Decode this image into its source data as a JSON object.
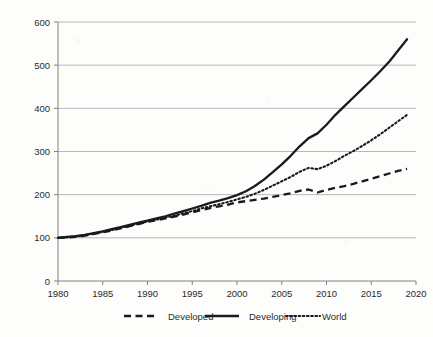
{
  "chart_data": {
    "type": "line",
    "title": "",
    "subtitle": "",
    "xlabel": "",
    "ylabel": "",
    "xlim": [
      1980,
      2020
    ],
    "ylim": [
      0,
      600
    ],
    "xticks": [
      1980,
      1985,
      1990,
      1995,
      2000,
      2005,
      2010,
      2015,
      2020
    ],
    "yticks": [
      0,
      100,
      200,
      300,
      400,
      500,
      600
    ],
    "grid": "horizontal",
    "legend_position": "bottom",
    "background_color": "#fdfdfb",
    "axis_color": "#808080",
    "grid_color": "#a6a6a6",
    "line_color": "#1a1a1a",
    "x": [
      1980,
      1981,
      1982,
      1983,
      1984,
      1985,
      1986,
      1987,
      1988,
      1989,
      1990,
      1991,
      1992,
      1993,
      1994,
      1995,
      1996,
      1997,
      1998,
      1999,
      2000,
      2001,
      2002,
      2003,
      2004,
      2005,
      2006,
      2007,
      2008,
      2009,
      2010,
      2011,
      2012,
      2013,
      2014,
      2015,
      2016,
      2017,
      2018,
      2019
    ],
    "series": [
      {
        "name": "Developed",
        "style": "dashed",
        "values": [
          100,
          101,
          102,
          105,
          109,
          113,
          117,
          122,
          127,
          132,
          137,
          141,
          145,
          149,
          154,
          159,
          164,
          169,
          173,
          177,
          182,
          185,
          188,
          191,
          195,
          199,
          203,
          209,
          212,
          205,
          211,
          216,
          220,
          225,
          231,
          237,
          243,
          249,
          255,
          260
        ]
      },
      {
        "name": "Developing",
        "style": "solid",
        "values": [
          100,
          102,
          104,
          107,
          111,
          115,
          120,
          125,
          130,
          135,
          140,
          145,
          150,
          156,
          162,
          168,
          174,
          181,
          186,
          192,
          199,
          208,
          220,
          235,
          252,
          270,
          290,
          312,
          331,
          342,
          362,
          385,
          405,
          425,
          445,
          465,
          486,
          508,
          534,
          560
        ]
      },
      {
        "name": "World",
        "style": "dotted",
        "values": [
          100,
          101,
          103,
          106,
          110,
          114,
          118,
          123,
          128,
          133,
          138,
          142,
          147,
          151,
          157,
          162,
          168,
          173,
          178,
          183,
          189,
          195,
          202,
          211,
          221,
          231,
          241,
          253,
          262,
          259,
          267,
          278,
          290,
          301,
          313,
          326,
          340,
          355,
          370,
          385
        ]
      }
    ]
  },
  "legend": {
    "items": [
      {
        "label": "Developed",
        "style": "dashed"
      },
      {
        "label": "Developing",
        "style": "solid"
      },
      {
        "label": "World",
        "style": "dotted"
      }
    ]
  }
}
